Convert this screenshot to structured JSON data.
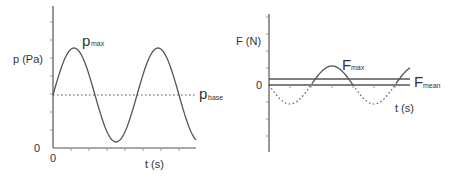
{
  "left_chart": {
    "ylabel": "p (Pa)",
    "xlabel": "t (s)",
    "y_origin_label": "0",
    "x_origin_label": "0",
    "peak_label_main": "p",
    "peak_label_sub": "max",
    "base_label_main": "p",
    "base_label_sub": "base",
    "curve": "sine wave oscillating about p_base",
    "baseline_style": "dotted"
  },
  "right_chart": {
    "ylabel": "F (N)",
    "xlabel": "t (s)",
    "zero_label": "0",
    "peak_label_main": "F",
    "peak_label_sub": "max",
    "mean_label_main": "F",
    "mean_label_sub": "mean",
    "curve": "sine wave about zero; positive half solid, negative half dotted"
  }
}
